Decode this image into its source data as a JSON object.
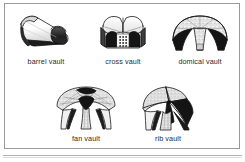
{
  "figure": {
    "background_color": "#ffffff",
    "frame_color": "#9a9a9a",
    "ink_color": "#1a1a1a",
    "caption_color": "#2b2b2b",
    "layout": {
      "rows": 2,
      "top_row_count": 3,
      "bottom_row_count": 2
    }
  },
  "items": [
    {
      "id": "barrel-vault",
      "label": "barrel vault",
      "icon": "barrel-vault-illustration",
      "row": 1,
      "column": 1
    },
    {
      "id": "cross-vault",
      "label": "cross vault",
      "icon": "cross-vault-illustration",
      "row": 1,
      "column": 2
    },
    {
      "id": "domical-vault",
      "label": "domical vault",
      "icon": "domical-vault-illustration",
      "row": 1,
      "column": 3
    },
    {
      "id": "fan-vault",
      "label": "fan vault",
      "icon": "fan-vault-illustration",
      "row": 2,
      "column": 1
    },
    {
      "id": "rib-vault",
      "label": "rib vault",
      "icon": "rib-vault-illustration",
      "row": 2,
      "column": 2
    }
  ]
}
